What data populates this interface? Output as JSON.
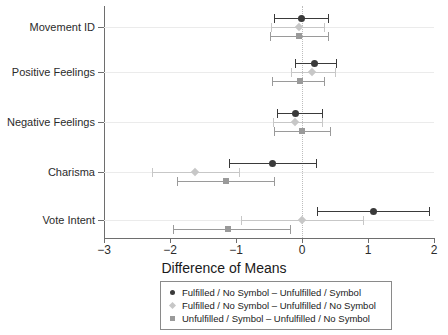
{
  "chart_data": {
    "type": "scatter",
    "title": "",
    "xlabel": "Difference of Means",
    "ylabel": "",
    "xlim": [
      -3,
      2
    ],
    "xticks": [
      -3,
      -2,
      -1,
      0,
      1,
      2
    ],
    "xticklabels": [
      "−3",
      "−2",
      "−1",
      "0",
      "1",
      "2"
    ],
    "categories": [
      "Movement ID",
      "Positive Feelings",
      "Negative Feelings",
      "Charisma",
      "Vote Intent"
    ],
    "grid": "horizontal",
    "reference_line": 0,
    "legend_position": "below",
    "series": [
      {
        "name": "Fulfilled / No Symbol – Unfulfilled / Symbol",
        "marker": "circle",
        "color": "#3a3a3a",
        "values": [
          -0.01,
          0.19,
          -0.1,
          -0.45,
          1.08
        ],
        "ci_low": [
          -0.42,
          -0.1,
          -0.38,
          -1.11,
          0.22
        ],
        "ci_high": [
          0.4,
          0.52,
          0.3,
          0.21,
          1.93
        ]
      },
      {
        "name": "Fulfilled / No Symbol – Unfulfilled / No Symbol",
        "marker": "diamond",
        "color": "#c7c7c7",
        "values": [
          -0.05,
          0.15,
          -0.1,
          -1.62,
          0.0
        ],
        "ci_low": [
          -0.47,
          -0.16,
          -0.44,
          -2.27,
          -0.92
        ],
        "ci_high": [
          0.34,
          0.5,
          0.3,
          -0.95,
          0.92
        ]
      },
      {
        "name": "Unfulfilled / Symbol – Unfulfilled / No Symbol",
        "marker": "square",
        "color": "#9a9a9a",
        "values": [
          -0.04,
          -0.03,
          0.0,
          -1.15,
          -1.12
        ],
        "ci_low": [
          -0.49,
          -0.45,
          -0.42,
          -1.9,
          -1.95
        ],
        "ci_high": [
          0.39,
          0.34,
          0.42,
          -0.43,
          -0.18
        ]
      }
    ]
  },
  "legend": {
    "entries": [
      "Fulfilled / No Symbol – Unfulfilled / Symbol",
      "Fulfilled / No Symbol – Unfulfilled / No Symbol",
      "Unfulfilled / Symbol – Unfulfilled / No Symbol"
    ]
  }
}
